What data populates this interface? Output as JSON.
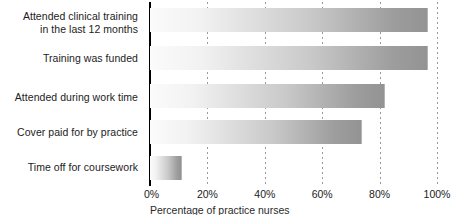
{
  "chart_data": {
    "type": "bar",
    "orientation": "horizontal",
    "title": "",
    "xlabel": "Percentage of practice nurses",
    "ylabel": "",
    "xlim": [
      0,
      100
    ],
    "xticks": [
      "0%",
      "20%",
      "40%",
      "60%",
      "80%",
      "100%"
    ],
    "xtick_values": [
      0,
      20,
      40,
      60,
      80,
      100
    ],
    "grid": true,
    "legend": false,
    "categories": [
      "Attended clinical training in the last 12 months",
      "Training was funded",
      "Attended during work time",
      "Cover paid for by practice",
      "Time off for coursework"
    ],
    "values": [
      97,
      97,
      82,
      74,
      11
    ],
    "bar_style": {
      "fill": "horizontal-gradient",
      "gradient_from": "#fbfbfb",
      "gradient_to": "#939393",
      "border": "#b4b4b4"
    }
  },
  "axis": {
    "category_labels": [
      {
        "line1": "Attended clinical training",
        "line2": "in the last 12 months"
      },
      {
        "line1": "Training was funded",
        "line2": ""
      },
      {
        "line1": "Attended during work time",
        "line2": ""
      },
      {
        "line1": "Cover paid for by practice",
        "line2": ""
      },
      {
        "line1": "Time off for coursework",
        "line2": ""
      }
    ],
    "x_tick_labels": [
      "0%",
      "20%",
      "40%",
      "60%",
      "80%",
      "100%"
    ],
    "x_axis_title": "Percentage of practice nurses"
  }
}
